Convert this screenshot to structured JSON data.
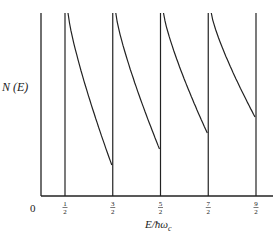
{
  "chart_data": {
    "type": "line",
    "title": "",
    "xlabel": "E/ħω_c",
    "ylabel": "N (E)",
    "x_origin_label": "0",
    "x_ticks": [
      {
        "value": 0.5,
        "label_num": "1",
        "label_den": "2"
      },
      {
        "value": 1.5,
        "label_num": "3",
        "label_den": "2"
      },
      {
        "value": 2.5,
        "label_num": "5",
        "label_den": "2"
      },
      {
        "value": 3.5,
        "label_num": "7",
        "label_den": "2"
      },
      {
        "value": 4.5,
        "label_num": "9",
        "label_den": "2"
      }
    ],
    "series": [
      {
        "name": "N(E)",
        "segment_starts": [
          0.5,
          1.5,
          2.5,
          3.5
        ],
        "segment_end_relative_heights": [
          0.17,
          0.26,
          0.35,
          0.43
        ]
      }
    ],
    "grid": false,
    "legend": null
  }
}
